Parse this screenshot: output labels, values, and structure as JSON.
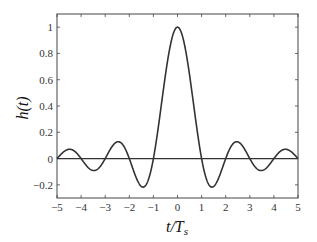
{
  "chart_data": {
    "type": "line",
    "title": "",
    "xlabel": "t/T_s",
    "xlabel_parts": {
      "main": "t/T",
      "sub": "s"
    },
    "ylabel": "h(t)",
    "xlim": [
      -5,
      5
    ],
    "ylim": [
      -0.3,
      1.1
    ],
    "xticks": [
      -5,
      -4,
      -3,
      -2,
      -1,
      0,
      1,
      2,
      3,
      4,
      5
    ],
    "xtick_labels": [
      "−5",
      "−4",
      "−3",
      "−2",
      "−1",
      "0",
      "1",
      "2",
      "3",
      "4",
      "5"
    ],
    "yticks": [
      -0.2,
      0,
      0.2,
      0.4,
      0.6,
      0.8,
      1
    ],
    "ytick_labels": [
      "−0.2",
      "0",
      "0.2",
      "0.4",
      "0.6",
      "0.8",
      "1"
    ],
    "grid": false,
    "legend": null,
    "zero_line": true,
    "series": [
      {
        "name": "h(t) = sinc(t/Ts)",
        "function": "sin(pi*x)/(pi*x)",
        "x": [
          -5,
          -4.5,
          -4,
          -3.5,
          -3,
          -2.5,
          -2,
          -1.5,
          -1,
          -0.5,
          0,
          0.5,
          1,
          1.5,
          2,
          2.5,
          3,
          3.5,
          4,
          4.5,
          5
        ],
        "values": [
          0,
          0.071,
          0,
          -0.091,
          0,
          0.127,
          0,
          -0.212,
          0,
          0.637,
          1,
          0.637,
          0,
          -0.212,
          0,
          0.127,
          0,
          -0.091,
          0,
          0.071,
          0
        ],
        "color": "#333333"
      }
    ]
  }
}
